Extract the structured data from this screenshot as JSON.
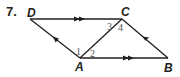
{
  "problem": {
    "number": "7."
  },
  "diagram": {
    "type": "parallelogram-with-diagonal",
    "points": [
      {
        "name": "D",
        "x": 30,
        "y": 19
      },
      {
        "name": "C",
        "x": 122,
        "y": 19
      },
      {
        "name": "A",
        "x": 80,
        "y": 58
      },
      {
        "name": "B",
        "x": 168,
        "y": 58
      }
    ],
    "labels": {
      "D": "D",
      "C": "C",
      "A": "A",
      "B": "B"
    },
    "angles": {
      "a1": "1",
      "a2": "2",
      "a3": "3",
      "a4": "4"
    },
    "segments": [
      {
        "from": "D",
        "to": "C",
        "marks": "double-arrow"
      },
      {
        "from": "A",
        "to": "B",
        "marks": "double-arrow"
      },
      {
        "from": "A",
        "to": "D",
        "marks": "single-arrow"
      },
      {
        "from": "B",
        "to": "C",
        "marks": "single-arrow"
      },
      {
        "from": "A",
        "to": "C",
        "marks": "none"
      }
    ],
    "stroke_color": "#231f20"
  }
}
